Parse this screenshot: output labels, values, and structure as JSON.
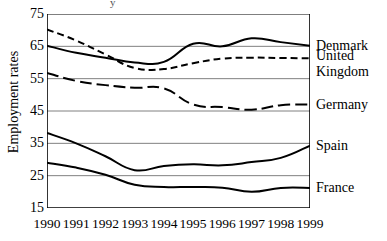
{
  "artifact": {
    "text": "y"
  },
  "axes": {
    "ylabel": "Employment rates",
    "xlabel": "",
    "yticks": [
      "75",
      "65",
      "55",
      "45",
      "35",
      "25",
      "15"
    ],
    "xticks": [
      "1990",
      "1991",
      "1992",
      "1993",
      "1994",
      "1995",
      "1996",
      "1997",
      "1998",
      "1999"
    ]
  },
  "series_labels": [
    {
      "name": "Denmark"
    },
    {
      "name": "United"
    },
    {
      "name": "Kingdom"
    },
    {
      "name": "Germany"
    },
    {
      "name": "Spain"
    },
    {
      "name": "France"
    }
  ],
  "colors": {
    "line": "#000000",
    "grid": "#808080",
    "axis": "#000000",
    "background": "#ffffff"
  },
  "chart_data": {
    "type": "line",
    "title": "",
    "xlabel": "",
    "ylabel": "Employment rates",
    "x": [
      1990,
      1991,
      1992,
      1993,
      1994,
      1995,
      1996,
      1997,
      1998,
      1999
    ],
    "categories": [
      "1990",
      "1991",
      "1992",
      "1993",
      "1994",
      "1995",
      "1996",
      "1997",
      "1998",
      "1999"
    ],
    "ylim": [
      15,
      75
    ],
    "yticks": [
      15,
      25,
      35,
      45,
      55,
      65,
      75
    ],
    "grid": "horizontal",
    "legend": "right-inline",
    "series": [
      {
        "name": "Denmark",
        "style": "solid",
        "values": [
          65.2,
          63.0,
          61.5,
          60.0,
          60.2,
          65.8,
          65.0,
          67.5,
          66.3,
          65.2
        ]
      },
      {
        "name": "United Kingdom",
        "style": "dashed-short",
        "values": [
          70.2,
          66.8,
          62.5,
          58.3,
          58.0,
          59.8,
          61.2,
          61.5,
          61.4,
          61.3
        ]
      },
      {
        "name": "Germany",
        "style": "dashed-long",
        "values": [
          56.8,
          54.3,
          53.0,
          52.2,
          52.0,
          47.0,
          46.2,
          45.4,
          46.8,
          47.0
        ]
      },
      {
        "name": "Spain",
        "style": "solid",
        "values": [
          38.2,
          35.0,
          31.0,
          26.7,
          28.0,
          28.5,
          28.2,
          29.2,
          30.5,
          34.3
        ]
      },
      {
        "name": "France",
        "style": "solid",
        "values": [
          29.0,
          27.5,
          25.3,
          22.2,
          21.5,
          21.5,
          21.3,
          20.0,
          21.2,
          21.2
        ]
      }
    ]
  }
}
